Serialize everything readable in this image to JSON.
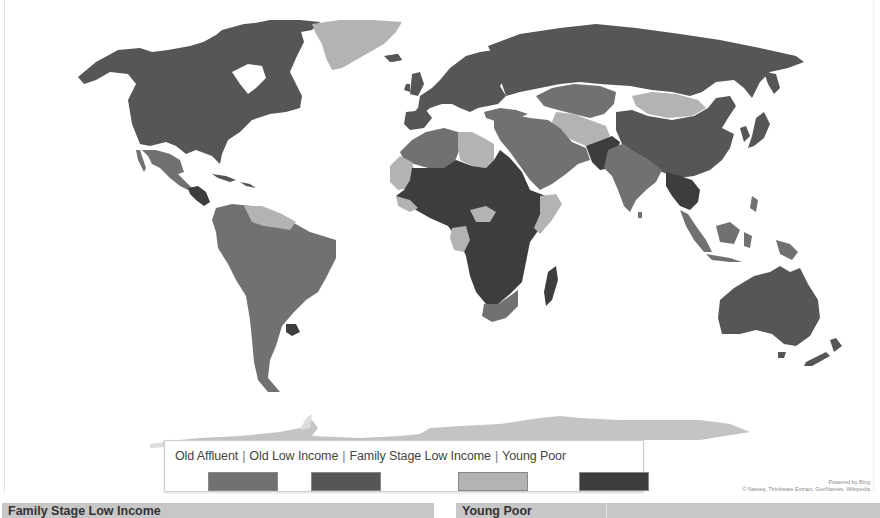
{
  "map": {
    "provider": "Bing Maps",
    "attribution": {
      "powered_by": "Powered by Bing",
      "credits": "© Navteq, Thinkware Extract, GeoNames, Wikipedia"
    },
    "colors": {
      "old_affluent": "#717171",
      "old_low_income": "#565656",
      "family_stage_low_income": "#b3b3b3",
      "young_poor": "#3d3d3d",
      "ocean": "#ffffff",
      "antarctica": "#c4c4c4"
    },
    "regions": [
      {
        "name": "North America (USA, Canada)",
        "category": "Old Low Income"
      },
      {
        "name": "Alaska",
        "category": "Old Low Income"
      },
      {
        "name": "Greenland",
        "category": "Family Stage Low Income"
      },
      {
        "name": "Mexico",
        "category": "Old Affluent"
      },
      {
        "name": "Central America",
        "category": "Young Poor"
      },
      {
        "name": "Venezuela / Guianas",
        "category": "Family Stage Low Income"
      },
      {
        "name": "South America",
        "category": "Old Affluent"
      },
      {
        "name": "Uruguay",
        "category": "Young Poor"
      },
      {
        "name": "Europe",
        "category": "Old Low Income"
      },
      {
        "name": "Russia",
        "category": "Old Low Income"
      },
      {
        "name": "Kazakhstan",
        "category": "Old Affluent"
      },
      {
        "name": "Mongolia",
        "category": "Family Stage Low Income"
      },
      {
        "name": "China",
        "category": "Old Low Income"
      },
      {
        "name": "Middle East",
        "category": "Old Affluent"
      },
      {
        "name": "Afghanistan / Pakistan",
        "category": "Young Poor"
      },
      {
        "name": "India",
        "category": "Old Affluent"
      },
      {
        "name": "Southeast Asia (Indochina)",
        "category": "Young Poor"
      },
      {
        "name": "Indonesia",
        "category": "Old Affluent"
      },
      {
        "name": "North Africa (Algeria)",
        "category": "Old Affluent"
      },
      {
        "name": "Libya",
        "category": "Family Stage Low Income"
      },
      {
        "name": "Sub-Saharan Africa",
        "category": "Young Poor"
      },
      {
        "name": "Southern Africa",
        "category": "Old Affluent"
      },
      {
        "name": "Madagascar",
        "category": "Young Poor"
      },
      {
        "name": "Australia",
        "category": "Old Low Income"
      },
      {
        "name": "New Zealand",
        "category": "Old Low Income"
      },
      {
        "name": "Antarctica",
        "category": "Family Stage Low Income"
      }
    ]
  },
  "legend": {
    "items": [
      {
        "label": "Old Affluent",
        "color": "#717171"
      },
      {
        "label": "Old Low Income",
        "color": "#565656"
      },
      {
        "label": "Family Stage Low Income",
        "color": "#b3b3b3"
      },
      {
        "label": "Young Poor",
        "color": "#3d3d3d"
      }
    ],
    "separator": "|"
  },
  "panels": {
    "left_title": "Family Stage Low Income",
    "right_title": "Young Poor"
  }
}
